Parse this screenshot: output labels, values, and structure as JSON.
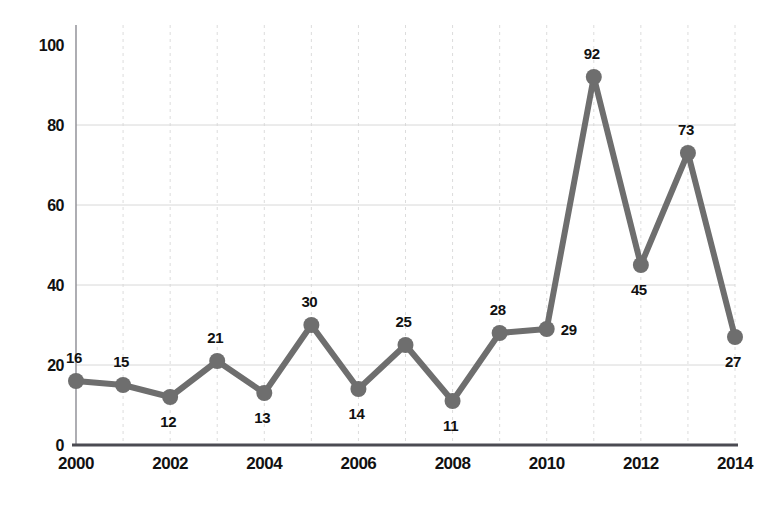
{
  "chart_data": {
    "type": "line",
    "title": "",
    "subtitle": "",
    "xlabel": "",
    "ylabel": "",
    "categories": [
      2000,
      2001,
      2002,
      2003,
      2004,
      2005,
      2006,
      2007,
      2008,
      2009,
      2010,
      2011,
      2012,
      2013,
      2014
    ],
    "values": [
      16,
      15,
      12,
      21,
      13,
      30,
      14,
      25,
      11,
      28,
      29,
      92,
      45,
      73,
      27
    ],
    "point_labels": [
      "16",
      "15",
      "12",
      "21",
      "13",
      "30",
      "14",
      "25",
      "11",
      "28",
      "29",
      "92",
      "45",
      "73",
      "27"
    ],
    "label_positions": [
      "above",
      "above",
      "below",
      "above",
      "below",
      "above",
      "below",
      "above",
      "below",
      "above",
      "right",
      "above",
      "below",
      "above",
      "below"
    ],
    "xlim": [
      2000,
      2014
    ],
    "ylim": [
      0,
      100
    ],
    "x_ticks": [
      2000,
      2002,
      2004,
      2006,
      2008,
      2010,
      2012,
      2014
    ],
    "x_tick_labels": [
      "2000",
      "2002",
      "2004",
      "2006",
      "2008",
      "2010",
      "2012",
      "2014"
    ],
    "y_ticks": [
      0,
      20,
      40,
      60,
      80,
      100
    ],
    "y_tick_labels": [
      "0",
      "20",
      "40",
      "60",
      "80",
      "100"
    ],
    "grid": {
      "horizontal": true,
      "vertical": true,
      "horizontal_values": [
        20,
        40,
        60,
        80
      ],
      "vertical_values": [
        2001,
        2002,
        2003,
        2004,
        2005,
        2006,
        2007,
        2008,
        2009,
        2010,
        2011,
        2012,
        2013,
        2014
      ]
    },
    "legend": {
      "visible": false,
      "position": "none",
      "entries": []
    },
    "colors": {
      "series": "#6e6e6e",
      "marker": "#6e6e6e",
      "axis_x": "#4b4b52",
      "axis_y": "#8b8b92",
      "grid": "#dcdcdc",
      "text": "#111111",
      "background": "#ffffff"
    },
    "series": [
      {
        "name": "series-1",
        "values": [
          16,
          15,
          12,
          21,
          13,
          30,
          14,
          25,
          11,
          28,
          29,
          92,
          45,
          73,
          27
        ]
      }
    ]
  }
}
